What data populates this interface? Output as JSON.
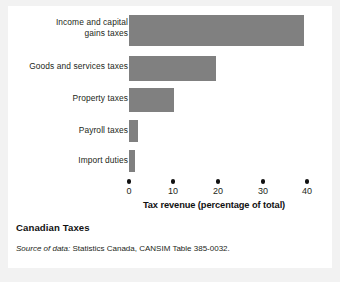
{
  "figure": {
    "caption_title": "Canadian Taxes",
    "source_lead": "Source of data:",
    "source_text": " Statistics Canada, CANSIM Table 385-0032.",
    "bar_color": "#808080",
    "text_color": "#231f20",
    "background": "#ffffff",
    "page_background": "#f2f2f2"
  },
  "chart_data": {
    "type": "bar",
    "orientation": "horizontal",
    "title": "Canadian Taxes",
    "xlabel": "Tax revenue (percentage of total)",
    "ylabel": "",
    "categories": [
      "Income and capital gains taxes",
      "Goods and services taxes",
      "Property taxes",
      "Payroll taxes",
      "Import duties"
    ],
    "category_lines": [
      [
        "Income and capital",
        "gains taxes"
      ],
      [
        "Goods and services taxes"
      ],
      [
        "Property taxes"
      ],
      [
        "Payroll taxes"
      ],
      [
        "Import duties"
      ]
    ],
    "values": [
      39.3,
      19.5,
      10.0,
      2.0,
      1.3
    ],
    "xlim": [
      0,
      40
    ],
    "xticks": [
      0,
      10,
      20,
      30,
      40
    ],
    "xtick_labels": [
      "0",
      "10",
      "20",
      "30",
      "40"
    ],
    "grid": false,
    "legend": null,
    "tick_marker_style": "dot",
    "series_color": "#808080"
  }
}
